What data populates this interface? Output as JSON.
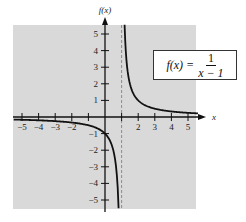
{
  "chart_data": {
    "type": "line",
    "title": "",
    "function_label": {
      "lhs": "f(x) =",
      "numerator": "1",
      "denominator": "x − 1"
    },
    "xlabel": "x",
    "ylabel": "f(x)",
    "xlim": [
      -5.5,
      5.5
    ],
    "ylim": [
      -5.5,
      5.5
    ],
    "x_ticks": [
      -5,
      -4,
      -3,
      -2,
      -1,
      1,
      2,
      3,
      4,
      5
    ],
    "x_tick_labels": [
      "−5",
      "−4",
      "−3",
      "−2",
      "",
      "",
      "2",
      "3",
      "4",
      "5"
    ],
    "y_ticks": [
      -5,
      -4,
      -3,
      -2,
      -1,
      1,
      2,
      3,
      4,
      5
    ],
    "y_tick_labels": [
      "−5",
      "−4",
      "−3",
      "−2",
      "−1",
      "1",
      "2",
      "3",
      "4",
      "5"
    ],
    "vertical_asymptote": 1,
    "horizontal_asymptote": 0,
    "grid": false,
    "background": "#d9d9d9",
    "series": [
      {
        "name": "left branch",
        "x": [
          -5.5,
          -4,
          -3,
          -2,
          -1,
          0,
          0.5,
          0.8
        ],
        "y": [
          -0.154,
          -0.2,
          -0.25,
          -0.333,
          -0.5,
          -1,
          -2,
          -5
        ]
      },
      {
        "name": "right branch",
        "x": [
          1.18,
          1.25,
          1.5,
          2,
          3,
          4,
          5
        ],
        "y": [
          5.5,
          4,
          2,
          1,
          0.5,
          0.333,
          0.25
        ]
      }
    ]
  }
}
